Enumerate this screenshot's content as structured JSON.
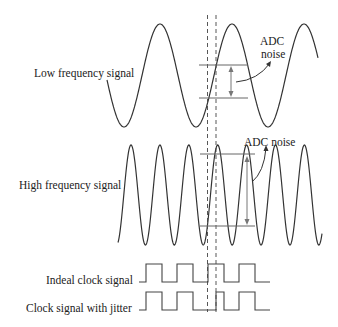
{
  "labels": {
    "low_frequency": "Low frequency signal",
    "high_frequency": "High frequency signal",
    "ideal_clock": "Indeal clock signal",
    "jitter_clock": "Clock signal with jitter",
    "adc_noise_low_line1": "ADC",
    "adc_noise_low_line2": "noise",
    "adc_noise_high": "ADC noise"
  },
  "signals": {
    "low_frequency_cycles_visible": 3,
    "high_frequency_cycles_visible": 7,
    "frequency_ratio": 2.5
  },
  "clock": {
    "ideal_pattern": [
      0,
      1,
      0,
      1,
      0,
      1,
      0,
      1,
      0
    ],
    "jitter_pattern": [
      0,
      1,
      0,
      1,
      0,
      0,
      1,
      0,
      1,
      0
    ]
  },
  "colors": {
    "signal": "#333333",
    "guide": "#666666",
    "text": "#222222"
  }
}
